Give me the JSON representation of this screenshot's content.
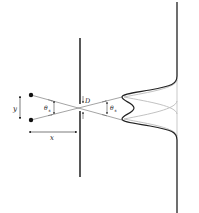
{
  "diagram": {
    "type": "pinhole-resolution-diagram",
    "labels": {
      "y": "y",
      "x": "x",
      "D": "D",
      "theta_left": "θ",
      "theta_left_sub": "s",
      "theta_right": "θ",
      "theta_right_sub": "s"
    },
    "colors": {
      "line": "#111111",
      "ray": "#666666",
      "summed_curve": "#222222",
      "individual_curve": "#bbbbbb",
      "point_source": "#111111"
    },
    "elements": [
      "point-source-top",
      "point-source-bottom",
      "barrier-with-aperture",
      "screen",
      "summed-intensity-curve",
      "individual-intensity-curves"
    ]
  }
}
